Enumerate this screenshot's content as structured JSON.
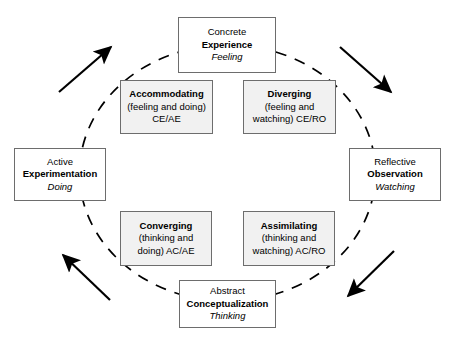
{
  "diagram": {
    "ellipse": {
      "stroke_color": "#000000",
      "dash": "dashed"
    },
    "arrow_color": "#000000",
    "stage_box_fill": "#ffffff",
    "style_box_fill": "#f1f1f1",
    "border_color": "#6d6d6d"
  },
  "stages": {
    "concrete_experience": {
      "line1": "Concrete",
      "line2": "Experience",
      "line3": "Feeling"
    },
    "reflective_observation": {
      "line1": "Reflective",
      "line2": "Observation",
      "line3": "Watching"
    },
    "abstract_conceptualization": {
      "line1": "Abstract",
      "line2": "Conceptualization",
      "line3": "Thinking"
    },
    "active_experimentation": {
      "line1": "Active",
      "line2": "Experimentation",
      "line3": "Doing"
    }
  },
  "styles": {
    "accommodating": {
      "line1": "Accommodating",
      "line2": "(feeling and doing)",
      "line3": "CE/AE"
    },
    "diverging": {
      "line1": "Diverging",
      "line2": "(feeling and",
      "line3": "watching) CE/RO"
    },
    "converging": {
      "line1": "Converging",
      "line2": "(thinking and",
      "line3": "doing) AC/AE"
    },
    "assimilating": {
      "line1": "Assimilating",
      "line2": "(thinking and",
      "line3": "watching) AC/RO"
    }
  },
  "arrows": [
    {
      "name": "arrow-top-left-upward",
      "direction": "up-right"
    },
    {
      "name": "arrow-top-right-downward",
      "direction": "down-right"
    },
    {
      "name": "arrow-bottom-right-downward",
      "direction": "down-left"
    },
    {
      "name": "arrow-bottom-left-upward",
      "direction": "up-left"
    }
  ]
}
